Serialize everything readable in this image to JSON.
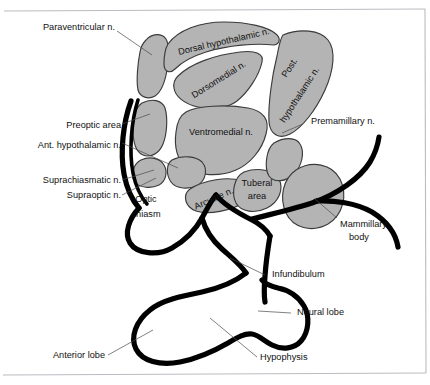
{
  "figure": {
    "background_color": "#ffffff",
    "nucleus_fill_color": "#b4b4b4",
    "nucleus_stroke_color": "#3b3b3b",
    "outline_color": "#000000",
    "leader_color": "#4a4a4a",
    "text_color": "#111111",
    "frame_color": "#b9bcc0"
  },
  "labels": {
    "paraventricular": "Paraventricular n.",
    "dorsal_hypothalamic": "Dorsal hypothalamic n.",
    "dorsomedial": "Dorsomedial n.",
    "post_hypothalamic_line1": "Post.",
    "post_hypothalamic_line2": "hypothalamic n.",
    "preoptic_area": "Preoptic area",
    "ant_hypothalamic": "Ant. hypothalamic n.",
    "ventromedial": "Ventromedial n.",
    "premamillary": "Premamillary n.",
    "suprachiasmatic": "Suprachiasmatic n.",
    "supraoptic": "Supraoptic n.",
    "optic_chiasm_line1": "Optic",
    "optic_chiasm_line2": "chiasm",
    "arcuate": "Arcuate n.",
    "tuberal_line1": "Tuberal",
    "tuberal_line2": "area",
    "mammillary_line1": "Mammillary",
    "mammillary_line2": "body",
    "infundibulum": "Infundibulum",
    "neural_lobe": "Neural lobe",
    "anterior_lobe": "Anterior lobe",
    "hypophysis": "Hypophysis"
  }
}
